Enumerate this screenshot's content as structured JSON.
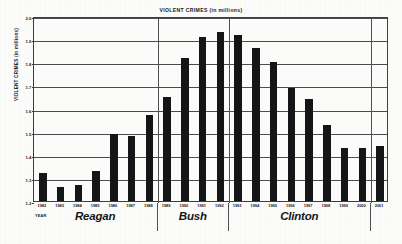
{
  "chart_data": {
    "type": "bar",
    "title": "VIOLENT CRIMES (in millions)",
    "xlabel": "YEAR",
    "ylabel": "VIOLENT CRIMES (in millions)",
    "ylim": [
      1.2,
      2.0
    ],
    "ytick_labels": [
      "2.0",
      "1.9",
      "1.8",
      "1.7",
      "1.6",
      "1.5",
      "1.4",
      "1.3",
      "1.2"
    ],
    "ytick_values": [
      2.0,
      1.9,
      1.8,
      1.7,
      1.6,
      1.5,
      1.4,
      1.3,
      1.2
    ],
    "grid": true,
    "legend": "none",
    "bar_color": "#141516",
    "categories": [
      "1982",
      "1983",
      "1984",
      "1985",
      "1986",
      "1987",
      "1988",
      "1989",
      "1990",
      "1991",
      "1992",
      "1993",
      "1994",
      "1995",
      "1996",
      "1997",
      "1998",
      "1999",
      "2000",
      "2001"
    ],
    "values": [
      1.32,
      1.26,
      1.27,
      1.33,
      1.49,
      1.48,
      1.57,
      1.65,
      1.82,
      1.91,
      1.93,
      1.92,
      1.86,
      1.8,
      1.69,
      1.64,
      1.53,
      1.43,
      1.43,
      1.44
    ],
    "annotations": [
      {
        "label": "Reagan",
        "start_year": "1982",
        "end_year": "1988"
      },
      {
        "label": "Bush",
        "start_year": "1989",
        "end_year": "1992"
      },
      {
        "label": "Clinton",
        "start_year": "1993",
        "end_year": "2000"
      }
    ],
    "divider_after": [
      "1988",
      "1992",
      "2000"
    ]
  }
}
